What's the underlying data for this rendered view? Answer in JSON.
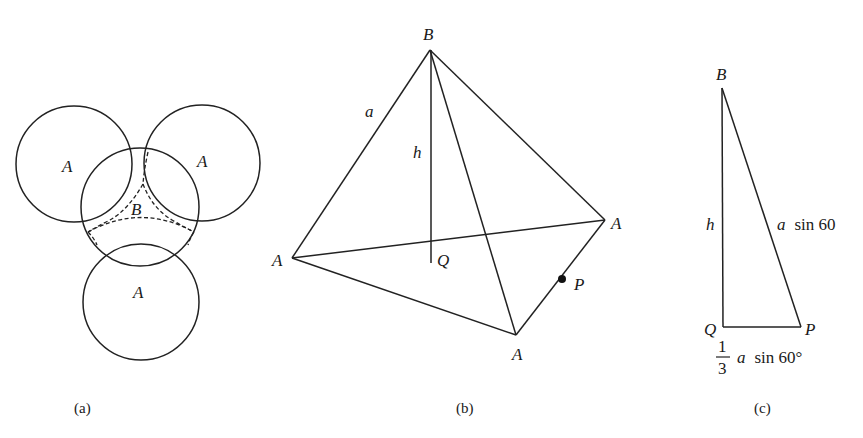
{
  "figure": {
    "panels": [
      {
        "id": "a",
        "caption": "(a)",
        "description": "Four overlapping circles; three outer circles labeled A, central curved region labeled B bounded by dashed arcs",
        "labels": {
          "circle_top_left": "A",
          "circle_top_right": "A",
          "circle_bottom": "A",
          "center_region": "B"
        }
      },
      {
        "id": "b",
        "caption": "(b)",
        "description": "Tetrahedron with apex B, three base vertices A, height h dropped to Q, edge a, point P on base edge",
        "labels": {
          "apex": "B",
          "vertex_left": "A",
          "vertex_right": "A",
          "vertex_bottom": "A",
          "edge": "a",
          "height": "h",
          "foot": "Q",
          "midpoint": "P"
        }
      },
      {
        "id": "c",
        "caption": "(c)",
        "description": "Right triangle BQP with legs h and (1/3) a sin 60°, hypotenuse a sin 60",
        "labels": {
          "top": "B",
          "bottom_left": "Q",
          "bottom_right": "P",
          "vertical_leg": "h",
          "hypotenuse": "a sin 60",
          "base_fraction_num": "1",
          "base_fraction_den": "3",
          "base_rest": "a sin 60°",
          "base_a": "a",
          "base_sin": "sin 60°",
          "hyp_a": "a",
          "hyp_sin": "sin 60"
        }
      }
    ]
  }
}
